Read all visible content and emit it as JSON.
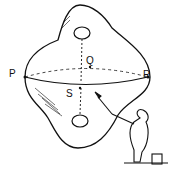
{
  "figure": {
    "labels": {
      "p": "P",
      "q": "Q",
      "r": "R",
      "s": "S"
    },
    "colors": {
      "ink": "#111111",
      "background": "#ffffff"
    }
  }
}
